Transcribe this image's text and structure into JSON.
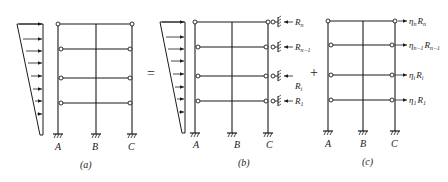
{
  "diagram": {
    "operators": {
      "equals": "=",
      "plus": "+"
    },
    "panels": [
      {
        "id": "a",
        "caption": "(a)",
        "supports": [
          "A",
          "B",
          "C"
        ],
        "load": "triangular lateral load (inverted trapezoid)",
        "right_labels": []
      },
      {
        "id": "b",
        "caption": "(b)",
        "supports": [
          "A",
          "B",
          "C"
        ],
        "load": "triangular lateral load with spring restraints at column C",
        "right_labels": [
          {
            "base": "R",
            "sub": "n"
          },
          {
            "base": "R",
            "sub": "n−1"
          },
          {
            "base": "R",
            "sub": "i"
          },
          {
            "base": "R",
            "sub": "1"
          }
        ]
      },
      {
        "id": "c",
        "caption": "(c)",
        "supports": [
          "A",
          "B",
          "C"
        ],
        "load": "reversed restraint forces",
        "right_labels": [
          {
            "coef": "η",
            "coef_sub": "n",
            "base": "R",
            "sub": "n"
          },
          {
            "coef": "η",
            "coef_sub": "n−1",
            "base": "R",
            "sub": "n−1"
          },
          {
            "coef": "η",
            "coef_sub": "i",
            "base": "R",
            "sub": "i"
          },
          {
            "coef": "η",
            "coef_sub": "1",
            "base": "R",
            "sub": "1"
          }
        ]
      }
    ]
  }
}
